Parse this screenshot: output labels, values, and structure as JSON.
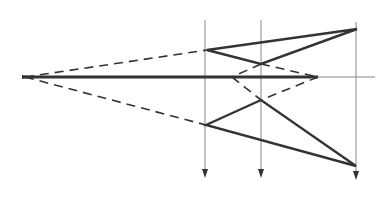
{
  "diagram": {
    "type": "optical-ray-construction",
    "colors": {
      "line": "#333333",
      "thin": "#888888",
      "background": "#ffffff"
    },
    "apex": {
      "x": 25,
      "y": 77
    },
    "axis": {
      "y": 77,
      "x_start": 25,
      "x_end": 375,
      "thick_end": 318
    },
    "vertical_lines": [
      {
        "x": 205,
        "y_top": 20,
        "y_bottom": 178
      },
      {
        "x": 261,
        "y_top": 20,
        "y_bottom": 178
      },
      {
        "x": 356,
        "y_top": 22,
        "y_bottom": 180
      }
    ],
    "upper_triangle": [
      [
        207,
        50
      ],
      [
        357,
        29
      ],
      [
        261,
        64
      ]
    ],
    "lower_triangle": [
      [
        206,
        125
      ],
      [
        261,
        100
      ],
      [
        356,
        166
      ]
    ],
    "dashed_lines": [
      [
        [
          25,
          77
        ],
        [
          207,
          50
        ]
      ],
      [
        [
          25,
          77
        ],
        [
          206,
          125
        ]
      ],
      [
        [
          261,
          64
        ],
        [
          318,
          77
        ]
      ],
      [
        [
          261,
          64
        ],
        [
          232,
          77
        ]
      ],
      [
        [
          232,
          77
        ],
        [
          261,
          100
        ]
      ],
      [
        [
          318,
          77
        ],
        [
          261,
          100
        ]
      ]
    ]
  }
}
